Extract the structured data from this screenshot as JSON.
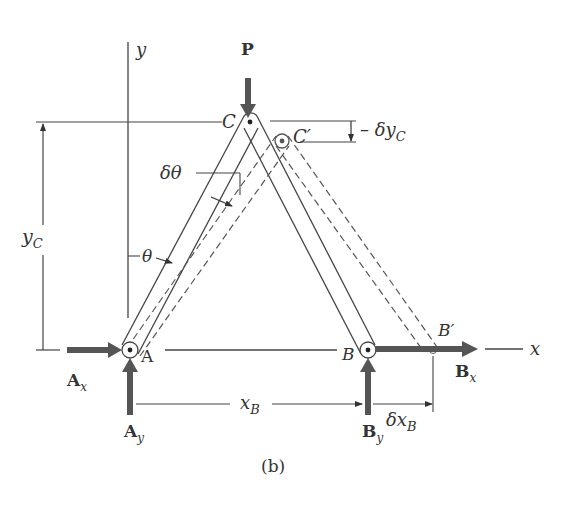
{
  "figure": {
    "caption": "(b)",
    "colors": {
      "line": "#444444",
      "force": "#555555",
      "dashed": "#555555",
      "background": "#ffffff"
    }
  },
  "axes": {
    "x_label": "x",
    "y_label": "y"
  },
  "points": {
    "A": "A",
    "B": "B",
    "C": "C",
    "C_prime": "C′",
    "B_prime": "B′"
  },
  "forces": {
    "P": "P",
    "Ax_main": "A",
    "Ax_sub": "x",
    "Ay_main": "A",
    "Ay_sub": "y",
    "Bx_main": "B",
    "Bx_sub": "x",
    "By_main": "B",
    "By_sub": "y"
  },
  "dimensions": {
    "yC_main": "y",
    "yC_sub": "C",
    "xB_main": "x",
    "xB_sub": "B",
    "dxB_main": "δx",
    "dxB_sub": "B",
    "dyC_main": "– δy",
    "dyC_sub": "C",
    "dtheta": "δθ",
    "theta": "θ"
  }
}
